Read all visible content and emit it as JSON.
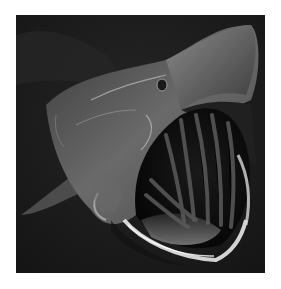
{
  "image": {
    "subject": "Basking shark with mouth wide open underwater",
    "style": "black-and-white photograph",
    "colors": {
      "background": "#ffffff",
      "water": "#1b1b1b",
      "body": "#6e6e6e",
      "highlight": "#e6e6e6",
      "mouth_interior": "#0d0d0d"
    }
  }
}
